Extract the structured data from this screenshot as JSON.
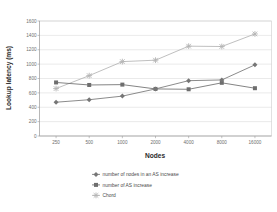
{
  "chart_data": {
    "type": "line",
    "title": "",
    "xlabel": "Nodes",
    "ylabel": "Lookup latency (ms)",
    "categories": [
      "250",
      "500",
      "1000",
      "2000",
      "4000",
      "8000",
      "16000"
    ],
    "x_tick_labels": [
      "250",
      "500",
      "1000",
      "2000",
      "4000",
      "8000",
      "16000"
    ],
    "y_tick_labels": [
      "0",
      "200",
      "400",
      "600",
      "800",
      "1000",
      "1200",
      "1400",
      "1600"
    ],
    "y_ticks": [
      0,
      200,
      400,
      600,
      800,
      1000,
      1200,
      1400,
      1600
    ],
    "ylim": [
      0,
      1600
    ],
    "grid": true,
    "legend_position": "bottom",
    "series": [
      {
        "name": "number of nodes in an AS increase",
        "values": [
          470,
          505,
          555,
          655,
          770,
          780,
          990
        ],
        "color": "#767676",
        "marker": "diamond"
      },
      {
        "name": "number of AS increase",
        "values": [
          745,
          710,
          715,
          655,
          650,
          740,
          665
        ],
        "color": "#6e6e6e",
        "marker": "square"
      },
      {
        "name": "Chord",
        "values": [
          660,
          840,
          1035,
          1055,
          1250,
          1245,
          1420
        ],
        "color": "#b4b4b4",
        "marker": "cross"
      }
    ]
  },
  "colors": {
    "series_nodes_in_as": "#767676",
    "series_as_increase": "#6e6e6e",
    "series_chord": "#b4b4b4",
    "grid": "#d4d4d4",
    "axis": "#9a9a9a",
    "text": "#4a4a4a",
    "background": "#ffffff"
  }
}
